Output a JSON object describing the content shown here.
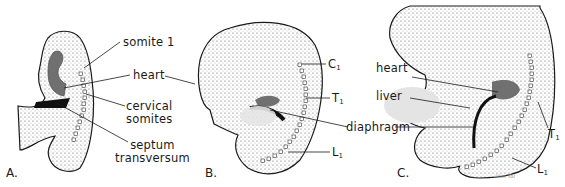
{
  "figure": {
    "panels": [
      {
        "id": "A",
        "label": "A."
      },
      {
        "id": "B",
        "label": "B."
      },
      {
        "id": "C",
        "label": "C."
      }
    ],
    "panel_a": {
      "labels": {
        "somite1": "somite 1",
        "heart": "heart",
        "cervical1": "cervical",
        "cervical2": "somites",
        "septum1": "septum",
        "septum2": "transversum"
      }
    },
    "panel_b": {
      "labels": {
        "c1": "C",
        "c1_sub": "1",
        "t1": "T",
        "t1_sub": "1",
        "l1": "L",
        "l1_sub": "1",
        "diaphragm": "diaphragm"
      }
    },
    "panel_c": {
      "labels": {
        "heart": "heart",
        "liver": "liver",
        "t1": "T",
        "t1_sub": "1",
        "l1": "L",
        "l1_sub": "1",
        "signature": "Van Tol"
      }
    },
    "colors": {
      "line": "#1a1a1a",
      "heart_fill": "#707070",
      "liver_fill": "#e4e4e4",
      "septum_fill": "#111111"
    }
  }
}
